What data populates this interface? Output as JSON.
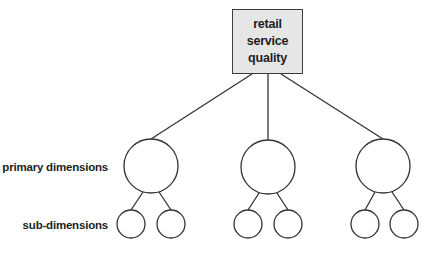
{
  "root": {
    "lines": [
      "retail",
      "service",
      "quality"
    ],
    "fill_color": "#e6e6e6",
    "border_color": "#3c3c3c"
  },
  "labels": {
    "primary": "primary dimensions",
    "sub": "sub-dimensions"
  },
  "tree": {
    "primary_dimensions": [
      {
        "cx": 151,
        "cy": 166,
        "r": 27,
        "sub_dimensions": [
          {
            "cx": 131,
            "cy": 224,
            "r": 14
          },
          {
            "cx": 171,
            "cy": 224,
            "r": 14
          }
        ]
      },
      {
        "cx": 268,
        "cy": 167,
        "r": 27,
        "sub_dimensions": [
          {
            "cx": 248,
            "cy": 224,
            "r": 14
          },
          {
            "cx": 288,
            "cy": 224,
            "r": 14
          }
        ]
      },
      {
        "cx": 383,
        "cy": 166,
        "r": 27,
        "sub_dimensions": [
          {
            "cx": 365,
            "cy": 224,
            "r": 14
          },
          {
            "cx": 404,
            "cy": 224,
            "r": 14
          }
        ]
      }
    ]
  },
  "stroke_color": "#333333"
}
